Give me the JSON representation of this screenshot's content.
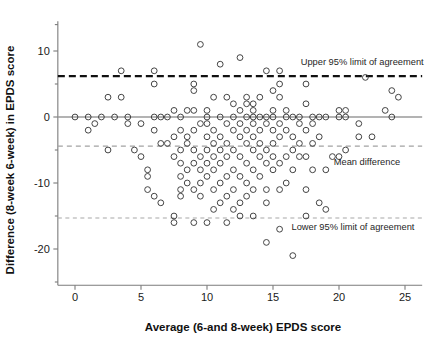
{
  "figure": {
    "type": "scatter",
    "description_name": "bland-altman-plot"
  },
  "chart_data": {
    "type": "scatter",
    "title": "",
    "xlabel": "Average (6-and 8-week) EPDS score",
    "ylabel": "Difference (8-week 6-week) in EPDS score",
    "xlim": [
      -1.3,
      26.3
    ],
    "ylim": [
      -25.5,
      14.5
    ],
    "xticks": [
      0,
      5,
      10,
      15,
      20,
      25
    ],
    "xtick_labels": [
      "0",
      "5",
      "10",
      "15",
      "20",
      "25"
    ],
    "yticks": [
      10,
      0,
      -10,
      -20
    ],
    "ytick_labels": [
      "10",
      "0",
      "-10",
      "-20"
    ],
    "ytick_minor": [
      14,
      5,
      -5,
      -15,
      -25
    ],
    "grid": false,
    "legend_position": "none",
    "marker": {
      "shape": "open-circle",
      "radius_px": 2.9,
      "edge_color": "#3b3b3b",
      "face_color": "none"
    },
    "reference_lines": [
      {
        "name": "upper-95-limit-of-agreement",
        "label": "Upper 95% limit of agreement",
        "y": 6.2,
        "style": "dashed",
        "color": "#111111",
        "width": 2.1,
        "label_x": 17.1,
        "label_y": 7.9
      },
      {
        "name": "mean-difference",
        "label": "Mean difference",
        "y": -4.4,
        "style": "dashed",
        "color": "#a2a2a2",
        "width": 1.2,
        "label_x": 19.6,
        "label_y": -7.2
      },
      {
        "name": "lower-95-limit-of-agreement",
        "label": "Lower 95% limit of agreement",
        "y": -15.3,
        "style": "dashed",
        "color": "#a8a8a8",
        "width": 1.1,
        "label_x": 16.4,
        "label_y": -17.1
      },
      {
        "name": "zero-line",
        "label": "",
        "y": 0,
        "style": "solid",
        "color": "#9a9a9a",
        "width": 1.6,
        "label_x": null,
        "label_y": null
      }
    ],
    "points": [
      [
        0.0,
        0
      ],
      [
        1.0,
        -2
      ],
      [
        1.0,
        0
      ],
      [
        1.5,
        -1
      ],
      [
        2.0,
        0
      ],
      [
        2.5,
        -5
      ],
      [
        2.5,
        3
      ],
      [
        3.0,
        0
      ],
      [
        3.5,
        3
      ],
      [
        3.5,
        7
      ],
      [
        4.0,
        0
      ],
      [
        4.0,
        -1
      ],
      [
        4.5,
        -5
      ],
      [
        5.0,
        -6
      ],
      [
        5.0,
        -1
      ],
      [
        5.5,
        -9
      ],
      [
        5.5,
        -11
      ],
      [
        5.5,
        -8
      ],
      [
        6.0,
        0
      ],
      [
        6.0,
        -2
      ],
      [
        6.0,
        -12
      ],
      [
        6.0,
        5
      ],
      [
        6.0,
        7
      ],
      [
        6.5,
        -13
      ],
      [
        6.5,
        -4
      ],
      [
        6.5,
        0
      ],
      [
        7.0,
        0
      ],
      [
        7.0,
        -4
      ],
      [
        7.5,
        -15
      ],
      [
        7.5,
        -3
      ],
      [
        7.5,
        -6
      ],
      [
        7.5,
        1
      ],
      [
        7.5,
        -16
      ],
      [
        8.0,
        -5
      ],
      [
        8.0,
        -2
      ],
      [
        8.0,
        -7
      ],
      [
        8.0,
        -9
      ],
      [
        8.0,
        -11
      ],
      [
        8.0,
        -12
      ],
      [
        8.0,
        0
      ],
      [
        8.5,
        -4
      ],
      [
        8.5,
        -8
      ],
      [
        8.5,
        -10
      ],
      [
        8.5,
        -3
      ],
      [
        8.5,
        1
      ],
      [
        9.0,
        -16
      ],
      [
        9.0,
        -11
      ],
      [
        9.0,
        -7
      ],
      [
        9.0,
        -5
      ],
      [
        9.0,
        -2
      ],
      [
        9.0,
        1
      ],
      [
        9.0,
        4
      ],
      [
        9.0,
        5
      ],
      [
        9.5,
        11
      ],
      [
        9.5,
        -1
      ],
      [
        9.5,
        -6
      ],
      [
        9.5,
        -8
      ],
      [
        9.5,
        -10
      ],
      [
        9.5,
        -12
      ],
      [
        10.0,
        -16
      ],
      [
        10.0,
        -9
      ],
      [
        10.0,
        -7
      ],
      [
        10.0,
        -5
      ],
      [
        10.0,
        -3
      ],
      [
        10.0,
        -1
      ],
      [
        10.0,
        1
      ],
      [
        10.0,
        0
      ],
      [
        10.5,
        -14
      ],
      [
        10.5,
        -11
      ],
      [
        10.5,
        -8
      ],
      [
        10.5,
        -6
      ],
      [
        10.5,
        -4
      ],
      [
        10.5,
        -2
      ],
      [
        10.5,
        3
      ],
      [
        11.0,
        -13
      ],
      [
        11.0,
        -10
      ],
      [
        11.0,
        -7
      ],
      [
        11.0,
        -5
      ],
      [
        11.0,
        -3
      ],
      [
        11.0,
        0
      ],
      [
        11.0,
        8
      ],
      [
        11.5,
        -16
      ],
      [
        11.5,
        -12
      ],
      [
        11.5,
        -9
      ],
      [
        11.5,
        -6
      ],
      [
        11.5,
        -4
      ],
      [
        11.5,
        -1
      ],
      [
        11.5,
        3
      ],
      [
        12.0,
        -14
      ],
      [
        12.0,
        -11
      ],
      [
        12.0,
        -8
      ],
      [
        12.0,
        -5
      ],
      [
        12.0,
        -2
      ],
      [
        12.0,
        0
      ],
      [
        12.0,
        2
      ],
      [
        12.5,
        -15
      ],
      [
        12.5,
        -13
      ],
      [
        12.5,
        -9
      ],
      [
        12.5,
        -6
      ],
      [
        12.5,
        -3
      ],
      [
        12.5,
        -1
      ],
      [
        12.5,
        1
      ],
      [
        12.5,
        9
      ],
      [
        13.0,
        -12
      ],
      [
        13.0,
        -10
      ],
      [
        13.0,
        -7
      ],
      [
        13.0,
        -4
      ],
      [
        13.0,
        -2
      ],
      [
        13.0,
        0
      ],
      [
        13.0,
        2
      ],
      [
        13.0,
        3
      ],
      [
        13.5,
        -15
      ],
      [
        13.5,
        -11
      ],
      [
        13.5,
        -8
      ],
      [
        13.5,
        -5
      ],
      [
        13.5,
        -3
      ],
      [
        13.5,
        -1
      ],
      [
        13.5,
        0
      ],
      [
        13.5,
        1
      ],
      [
        13.5,
        2
      ],
      [
        14.0,
        -9
      ],
      [
        14.0,
        -6
      ],
      [
        14.0,
        -4
      ],
      [
        14.0,
        -2
      ],
      [
        14.0,
        0
      ],
      [
        14.0,
        3
      ],
      [
        14.5,
        -19
      ],
      [
        14.5,
        -13
      ],
      [
        14.5,
        -11
      ],
      [
        14.5,
        -7
      ],
      [
        14.5,
        -5
      ],
      [
        14.5,
        -1
      ],
      [
        14.5,
        0
      ],
      [
        14.5,
        7
      ],
      [
        15.0,
        -8
      ],
      [
        15.0,
        -6
      ],
      [
        15.0,
        -4
      ],
      [
        15.0,
        -2
      ],
      [
        15.0,
        0
      ],
      [
        15.0,
        1
      ],
      [
        15.0,
        4
      ],
      [
        15.5,
        -17
      ],
      [
        15.5,
        -11
      ],
      [
        15.5,
        -7
      ],
      [
        15.5,
        -3
      ],
      [
        15.5,
        -1
      ],
      [
        15.5,
        3
      ],
      [
        15.5,
        5
      ],
      [
        15.5,
        7
      ],
      [
        16.0,
        -10
      ],
      [
        16.0,
        -6
      ],
      [
        16.0,
        -2
      ],
      [
        16.0,
        0
      ],
      [
        16.0,
        1
      ],
      [
        16.5,
        -21
      ],
      [
        16.5,
        -8
      ],
      [
        16.5,
        -5
      ],
      [
        16.5,
        -3
      ],
      [
        16.5,
        0
      ],
      [
        17.0,
        -6
      ],
      [
        17.0,
        -4
      ],
      [
        17.0,
        -1
      ],
      [
        17.0,
        0
      ],
      [
        17.5,
        -15
      ],
      [
        17.5,
        -11
      ],
      [
        17.5,
        -6
      ],
      [
        17.5,
        -2
      ],
      [
        17.5,
        2
      ],
      [
        17.5,
        5
      ],
      [
        18.0,
        -8
      ],
      [
        18.0,
        -4
      ],
      [
        18.0,
        -1
      ],
      [
        18.0,
        0
      ],
      [
        18.5,
        -13
      ],
      [
        18.5,
        -3
      ],
      [
        18.5,
        0
      ],
      [
        19.0,
        -14
      ],
      [
        19.0,
        -8
      ],
      [
        19.0,
        0
      ],
      [
        19.5,
        -6
      ],
      [
        20.0,
        0
      ],
      [
        20.0,
        1
      ],
      [
        20.0,
        -6
      ],
      [
        20.5,
        -5
      ],
      [
        20.5,
        0
      ],
      [
        20.5,
        1
      ],
      [
        21.5,
        -1
      ],
      [
        21.5,
        -3
      ],
      [
        22.0,
        6
      ],
      [
        22.5,
        -3
      ],
      [
        23.5,
        1
      ],
      [
        24.0,
        0
      ],
      [
        24.0,
        4
      ],
      [
        24.5,
        3
      ]
    ]
  },
  "axes": {
    "x_title": "Average (6-and 8-week) EPDS score",
    "y_title": "Difference (8-week 6-week) in EPDS score"
  }
}
